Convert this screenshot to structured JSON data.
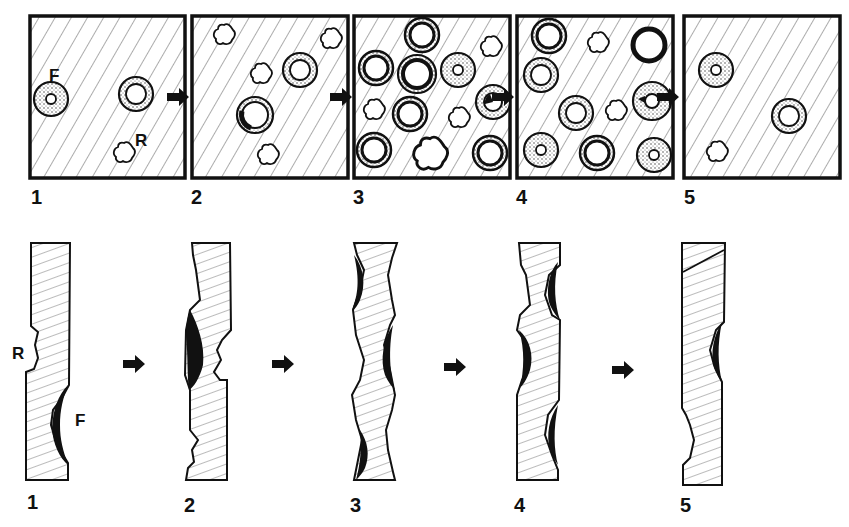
{
  "figure": {
    "top_row": {
      "panels": [
        {
          "label": "1",
          "marks": {
            "formation": "F",
            "resorption": "R"
          }
        },
        {
          "label": "2"
        },
        {
          "label": "3"
        },
        {
          "label": "4"
        },
        {
          "label": "5"
        }
      ]
    },
    "bottom_row": {
      "panels": [
        {
          "label": "1",
          "marks": {
            "resorption": "R",
            "formation": "F"
          }
        },
        {
          "label": "2"
        },
        {
          "label": "3"
        },
        {
          "label": "4"
        },
        {
          "label": "5"
        }
      ]
    },
    "arrow_icon": "right-arrow-icon",
    "colors": {
      "ink": "#111111",
      "background": "#ffffff",
      "hatch": "#555555"
    }
  }
}
